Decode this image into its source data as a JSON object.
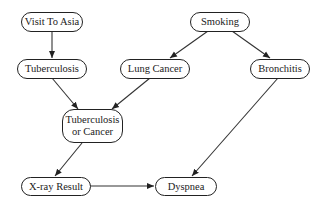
{
  "diagram": {
    "type": "bayesian-network",
    "nodes": [
      {
        "id": "visit_to_asia",
        "label": "Visit To Asia"
      },
      {
        "id": "smoking",
        "label": "Smoking"
      },
      {
        "id": "tuberculosis",
        "label": "Tuberculosis"
      },
      {
        "id": "lung_cancer",
        "label": "Lung Cancer"
      },
      {
        "id": "bronchitis",
        "label": "Bronchitis"
      },
      {
        "id": "tb_or_cancer",
        "label": "Tuberculosis or Cancer",
        "line1": "Tuberculosis",
        "line2": "or Cancer"
      },
      {
        "id": "xray_result",
        "label": "X-ray Result"
      },
      {
        "id": "dyspnea",
        "label": "Dyspnea"
      }
    ],
    "edges": [
      {
        "from": "visit_to_asia",
        "to": "tuberculosis"
      },
      {
        "from": "smoking",
        "to": "lung_cancer"
      },
      {
        "from": "smoking",
        "to": "bronchitis"
      },
      {
        "from": "tuberculosis",
        "to": "tb_or_cancer"
      },
      {
        "from": "lung_cancer",
        "to": "tb_or_cancer"
      },
      {
        "from": "tb_or_cancer",
        "to": "xray_result"
      },
      {
        "from": "bronchitis",
        "to": "dyspnea"
      },
      {
        "from": "xray_result",
        "to": "dyspnea"
      }
    ]
  }
}
